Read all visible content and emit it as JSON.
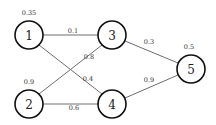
{
  "diagram": {
    "type": "weighted-graph",
    "nodes": [
      {
        "id": "1",
        "label": "1",
        "value": "0.35",
        "x": 29,
        "y": 35
      },
      {
        "id": "2",
        "label": "2",
        "value": "0.9",
        "x": 29,
        "y": 104
      },
      {
        "id": "3",
        "label": "3",
        "value": "",
        "x": 112,
        "y": 35
      },
      {
        "id": "4",
        "label": "4",
        "value": "",
        "x": 112,
        "y": 104
      },
      {
        "id": "5",
        "label": "5",
        "value": "0.5",
        "x": 191,
        "y": 69
      }
    ],
    "edges": [
      {
        "from": "1",
        "to": "3",
        "weight": "0.1"
      },
      {
        "from": "1",
        "to": "4",
        "weight": "0.4"
      },
      {
        "from": "2",
        "to": "3",
        "weight": "0.8"
      },
      {
        "from": "2",
        "to": "4",
        "weight": "0.6"
      },
      {
        "from": "3",
        "to": "5",
        "weight": "0.3"
      },
      {
        "from": "4",
        "to": "5",
        "weight": "0.9"
      }
    ]
  }
}
